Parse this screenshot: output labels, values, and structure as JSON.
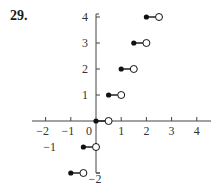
{
  "problem": {
    "number_label": "29."
  },
  "chart_data": {
    "type": "line",
    "subtype": "step-function",
    "title": "",
    "xlabel": "",
    "ylabel": "",
    "xlim": [
      -2.5,
      4.5
    ],
    "ylim": [
      -2.2,
      4.3
    ],
    "grid": false,
    "x_ticks": [
      -2,
      -1,
      0,
      1,
      2,
      3,
      4
    ],
    "x_tick_labels": [
      "−2",
      "−1",
      "0",
      "1",
      "2",
      "3",
      "4"
    ],
    "y_ticks": [
      4,
      3,
      2,
      1,
      -1,
      -2
    ],
    "y_tick_labels": [
      "4",
      "3",
      "2",
      "1",
      "−1",
      "−2"
    ],
    "segments": [
      {
        "x_start": -1.0,
        "x_end": -0.5,
        "y": -2,
        "start": "closed",
        "end": "open"
      },
      {
        "x_start": -0.5,
        "x_end": 0.0,
        "y": -1,
        "start": "closed",
        "end": "open"
      },
      {
        "x_start": 0.0,
        "x_end": 0.5,
        "y": 0,
        "start": "closed",
        "end": "open"
      },
      {
        "x_start": 0.5,
        "x_end": 1.0,
        "y": 1,
        "start": "closed",
        "end": "open"
      },
      {
        "x_start": 1.0,
        "x_end": 1.5,
        "y": 2,
        "start": "closed",
        "end": "open"
      },
      {
        "x_start": 1.5,
        "x_end": 2.0,
        "y": 3,
        "start": "closed",
        "end": "open"
      },
      {
        "x_start": 2.0,
        "x_end": 2.5,
        "y": 4,
        "start": "closed",
        "end": "open"
      }
    ]
  }
}
